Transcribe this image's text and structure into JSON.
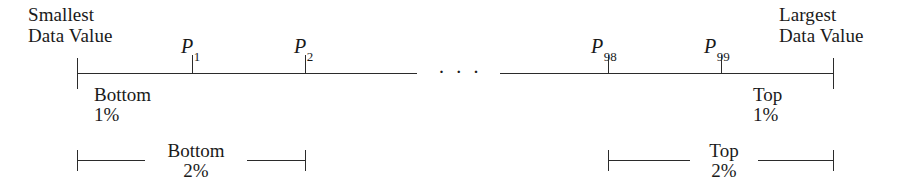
{
  "figure": {
    "type": "percentile-number-line-diagram",
    "width": 903,
    "height": 186,
    "line_color": "#2b2b2b",
    "background_color": "#ffffff"
  },
  "labels": {
    "smallest_line1": "Smallest",
    "smallest_line2": "Data Value",
    "largest_line1": "Largest",
    "largest_line2": "Data Value",
    "ellipsis": "· · ·"
  },
  "percentiles": [
    {
      "symbol": "P",
      "index": "1",
      "label": "P1",
      "x": 192
    },
    {
      "symbol": "P",
      "index": "2",
      "label": "P2",
      "x": 305
    },
    {
      "symbol": "P",
      "index": "98",
      "label": "P98",
      "x": 608
    },
    {
      "symbol": "P",
      "index": "99",
      "label": "P99",
      "x": 721
    }
  ],
  "regions": {
    "bottom1_line1": "Bottom",
    "bottom1_line2": "1%",
    "bottom2_line1": "Bottom",
    "bottom2_line2": "2%",
    "top1_line1": "Top",
    "top1_line2": "1%",
    "top2_line1": "Top",
    "top2_line2": "2%"
  },
  "axis": {
    "y": 73,
    "left_segment_start": 77,
    "left_segment_end": 417,
    "right_segment_start": 500,
    "right_segment_end": 833,
    "endcap_top": 58,
    "endcap_bottom": 88,
    "tick_top": 55,
    "tick_bottom": 73
  },
  "brackets": {
    "bottom2_start": 77,
    "bottom2_end": 305,
    "top2_start": 608,
    "top2_end": 833,
    "y": 160
  }
}
